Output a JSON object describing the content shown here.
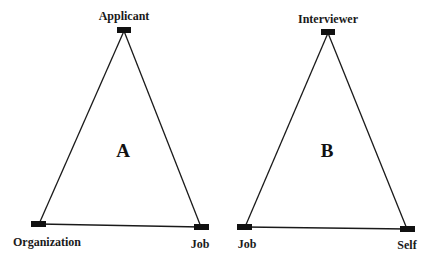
{
  "diagrams": [
    {
      "id": "A",
      "letter": "A",
      "nodes": [
        {
          "label": "Applicant",
          "x": 124,
          "y": 30,
          "label_x": 124,
          "label_y": 20
        },
        {
          "label": "Organization",
          "x": 39,
          "y": 224,
          "label_x": 47,
          "label_y": 246
        },
        {
          "label": "Job",
          "x": 201,
          "y": 227,
          "label_x": 200,
          "label_y": 248
        }
      ],
      "letter_pos": {
        "x": 123,
        "y": 157
      }
    },
    {
      "id": "B",
      "letter": "B",
      "nodes": [
        {
          "label": "Interviewer",
          "x": 328,
          "y": 32,
          "label_x": 328,
          "label_y": 23
        },
        {
          "label": "Job",
          "x": 245,
          "y": 227,
          "label_x": 247,
          "label_y": 248
        },
        {
          "label": "Self",
          "x": 407,
          "y": 229,
          "label_x": 407,
          "label_y": 249
        }
      ],
      "letter_pos": {
        "x": 327,
        "y": 157
      }
    }
  ],
  "colors": {
    "line": "#1a1a1a",
    "node": "#111111",
    "background": "#ffffff"
  }
}
